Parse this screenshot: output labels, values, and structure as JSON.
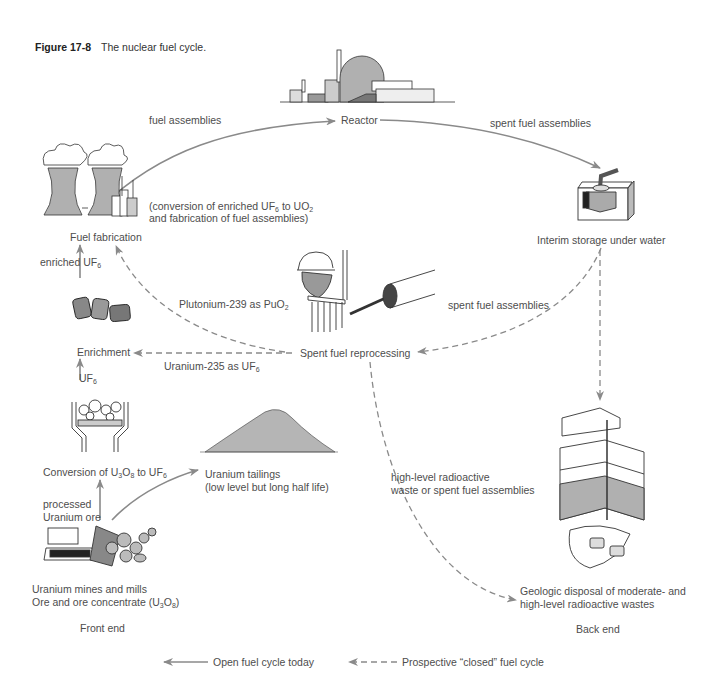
{
  "figure": {
    "number": "Figure 17-8",
    "title": "The nuclear fuel cycle."
  },
  "nodes": {
    "reactor": "Reactor",
    "interim_storage": "Interim storage under water",
    "fuel_fabrication": "Fuel fabrication",
    "fabrication_note_1_pre": "(conversion of  enriched UF",
    "fabrication_note_1_sub1": "6",
    "fabrication_note_1_mid": " to UO",
    "fabrication_note_1_sub2": "2",
    "fabrication_note_2": "and fabrication of fuel assemblies)",
    "enrichment": "Enrichment",
    "spent_fuel_reprocessing": "Spent fuel reprocessing",
    "conversion_pre": "Conversion of U",
    "conversion_sub1": "3",
    "conversion_mid": "O",
    "conversion_sub2": "8",
    "conversion_post": " to UF",
    "conversion_sub3": "6",
    "tailings_1": "Uranium tailings",
    "tailings_2": "(low level but long half life)",
    "mines_1": "Uranium mines  and mills",
    "mines_2_pre": "Ore and ore concentrate (U",
    "mines_2_sub1": "3",
    "mines_2_mid": "O",
    "mines_2_sub2": "8",
    "mines_2_post": ")",
    "geologic_1": "Geologic disposal of moderate- and",
    "geologic_2": "high-level radioactive wastes"
  },
  "flows": {
    "fuel_assemblies": "fuel assemblies",
    "spent_fuel_assemblies_top": "spent fuel assemblies",
    "enriched_uf6_pre": "enriched UF",
    "enriched_uf6_sub": "6",
    "plutonium_pre": "Plutonium-239 as PuO",
    "plutonium_sub": "2",
    "spent_fuel_assemblies_mid": "spent fuel assemblies",
    "uranium235_pre": "Uranium-235 as UF",
    "uranium235_sub": "6",
    "uf6_pre": "UF",
    "uf6_sub": "6",
    "processed_1": "processed",
    "processed_2": "Uranium ore",
    "highlevel_1": "high-level radioactive",
    "highlevel_2": "waste or spent fuel assemblies"
  },
  "sections": {
    "front_end": "Front end",
    "back_end": "Back end"
  },
  "legend": {
    "open_cycle": "Open fuel cycle today",
    "closed_cycle": "Prospective “closed” fuel cycle"
  },
  "colors": {
    "arrow": "#8a8a8a",
    "illustration_fill": "#b8b8b8",
    "text": "#4d4d4d"
  }
}
